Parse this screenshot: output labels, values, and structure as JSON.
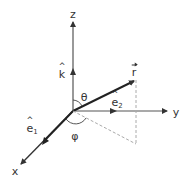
{
  "diagram": {
    "axes": {
      "z": {
        "label": "z"
      },
      "y": {
        "label": "y"
      },
      "x": {
        "label": "x"
      }
    },
    "vectors": {
      "k_hat": {
        "label": "k"
      },
      "e1_hat": {
        "label": "e",
        "subscript": "1"
      },
      "e2_hat": {
        "label": "e",
        "subscript": "2"
      },
      "r_vec": {
        "label": "r"
      }
    },
    "angles": {
      "theta": {
        "label": "θ"
      },
      "phi": {
        "label": "φ"
      }
    },
    "colors": {
      "line": "#333333",
      "axis": "#555555",
      "dashed": "#aaaaaa"
    }
  }
}
